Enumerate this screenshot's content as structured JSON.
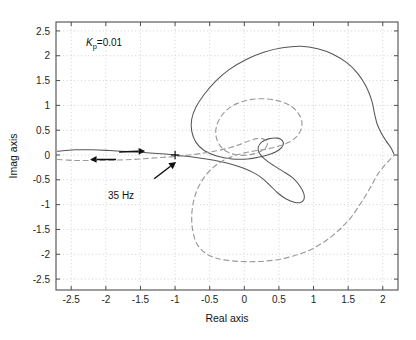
{
  "chart_data": {
    "type": "line",
    "title": "",
    "xlabel": "Real axis",
    "ylabel": "Imag axis",
    "xlim": [
      -2.72,
      2.22
    ],
    "ylim": [
      -2.72,
      2.68
    ],
    "xticks": [
      "-2.5",
      "-2",
      "-1.5",
      "-1",
      "-0.5",
      "0",
      "0.5",
      "1",
      "1.5",
      "2"
    ],
    "xtick_values": [
      -2.5,
      -2,
      -1.5,
      -1,
      -0.5,
      0,
      0.5,
      1,
      1.5,
      2
    ],
    "yticks": [
      "2.5",
      "2",
      "1.5",
      "1",
      "0.5",
      "0",
      "-0.5",
      "-1",
      "-1.5",
      "-2",
      "-2.5"
    ],
    "ytick_values": [
      2.5,
      2,
      1.5,
      1,
      0.5,
      0,
      -0.5,
      -1,
      -1.5,
      -2,
      -2.5
    ],
    "grid": true,
    "grid_style": "dotted",
    "legend": "none",
    "annotations": [
      {
        "name": "gain-annotation",
        "text_prefix": "K",
        "text_sub": "p",
        "text_suffix": "=0.01",
        "x": -2.1,
        "y": 2.28
      },
      {
        "name": "frequency-annotation",
        "text": "35 Hz",
        "x": -1.62,
        "y": -0.62,
        "points_to_x": -1.0,
        "points_to_y": -0.02
      }
    ],
    "markers": [
      {
        "name": "critical-point-marker",
        "symbol": "+",
        "x": -1.0,
        "y": 0.0
      }
    ],
    "direction_arrows": [
      {
        "name": "direction-arrow-right",
        "x": -1.62,
        "y": 0.06,
        "direction": "right",
        "series": "upper-solid"
      },
      {
        "name": "direction-arrow-left",
        "x": -2.04,
        "y": -0.09,
        "direction": "left",
        "series": "lower-dashed"
      }
    ],
    "series": [
      {
        "name": "nyquist-upper-solid",
        "style": "solid",
        "color": "#555555",
        "points": [
          [
            -2.7,
            0.075
          ],
          [
            -2.45,
            0.105
          ],
          [
            -2.2,
            0.105
          ],
          [
            -1.95,
            0.09
          ],
          [
            -1.7,
            0.07
          ],
          [
            -1.45,
            0.05
          ],
          [
            -1.2,
            0.025
          ],
          [
            -1.0,
            0.0
          ],
          [
            -0.8,
            -0.03
          ],
          [
            -0.55,
            -0.08
          ],
          [
            -0.35,
            -0.13
          ],
          [
            -0.15,
            -0.2
          ],
          [
            0.0,
            -0.27
          ],
          [
            0.14,
            -0.36
          ],
          [
            0.26,
            -0.47
          ],
          [
            0.37,
            -0.61
          ],
          [
            0.48,
            -0.76
          ],
          [
            0.6,
            -0.88
          ],
          [
            0.72,
            -0.95
          ],
          [
            0.8,
            -0.96
          ],
          [
            0.86,
            -0.9
          ],
          [
            0.86,
            -0.78
          ],
          [
            0.8,
            -0.62
          ],
          [
            0.7,
            -0.46
          ],
          [
            0.56,
            -0.33
          ],
          [
            0.42,
            -0.21
          ],
          [
            0.3,
            -0.09
          ],
          [
            0.22,
            0.03
          ],
          [
            0.2,
            0.15
          ],
          [
            0.25,
            0.26
          ],
          [
            0.36,
            0.33
          ],
          [
            0.48,
            0.34
          ],
          [
            0.55,
            0.29
          ],
          [
            0.56,
            0.2
          ],
          [
            0.5,
            0.1
          ],
          [
            0.38,
            0.02
          ],
          [
            0.22,
            -0.04
          ],
          [
            0.05,
            -0.08
          ],
          [
            -0.18,
            -0.08
          ],
          [
            -0.4,
            -0.02
          ],
          [
            -0.58,
            0.09
          ],
          [
            -0.7,
            0.26
          ],
          [
            -0.76,
            0.48
          ],
          [
            -0.76,
            0.72
          ],
          [
            -0.7,
            0.96
          ],
          [
            -0.58,
            1.22
          ],
          [
            -0.42,
            1.48
          ],
          [
            -0.22,
            1.72
          ],
          [
            0.02,
            1.92
          ],
          [
            0.28,
            2.07
          ],
          [
            0.55,
            2.16
          ],
          [
            0.82,
            2.19
          ],
          [
            1.06,
            2.14
          ],
          [
            1.28,
            2.03
          ],
          [
            1.48,
            1.86
          ],
          [
            1.64,
            1.64
          ],
          [
            1.76,
            1.38
          ],
          [
            1.84,
            1.1
          ],
          [
            1.88,
            0.84
          ],
          [
            1.92,
            0.62
          ],
          [
            1.98,
            0.44
          ],
          [
            2.05,
            0.28
          ],
          [
            2.12,
            0.14
          ],
          [
            2.16,
            0.02
          ]
        ]
      },
      {
        "name": "nyquist-lower-dashed",
        "style": "dashed",
        "color": "#9a9a9a",
        "points": [
          [
            -2.7,
            -0.09
          ],
          [
            -2.45,
            -0.11
          ],
          [
            -2.2,
            -0.11
          ],
          [
            -1.95,
            -0.105
          ],
          [
            -1.7,
            -0.095
          ],
          [
            -1.45,
            -0.075
          ],
          [
            -1.2,
            -0.05
          ],
          [
            -1.0,
            -0.03
          ],
          [
            -0.8,
            0.0
          ],
          [
            -0.58,
            0.04
          ],
          [
            -0.38,
            0.09
          ],
          [
            -0.2,
            0.15
          ],
          [
            -0.05,
            0.22
          ],
          [
            0.08,
            0.29
          ],
          [
            0.18,
            0.33
          ],
          [
            0.26,
            0.33
          ],
          [
            0.32,
            0.28
          ],
          [
            0.33,
            0.2
          ],
          [
            0.28,
            0.11
          ],
          [
            0.18,
            0.04
          ],
          [
            0.05,
            0.0
          ],
          [
            -0.1,
            0.0
          ],
          [
            -0.24,
            0.06
          ],
          [
            -0.34,
            0.17
          ],
          [
            -0.4,
            0.33
          ],
          [
            -0.41,
            0.52
          ],
          [
            -0.36,
            0.72
          ],
          [
            -0.26,
            0.9
          ],
          [
            -0.1,
            1.04
          ],
          [
            0.1,
            1.12
          ],
          [
            0.32,
            1.13
          ],
          [
            0.52,
            1.08
          ],
          [
            0.68,
            0.98
          ],
          [
            0.78,
            0.84
          ],
          [
            0.83,
            0.68
          ],
          [
            0.82,
            0.52
          ],
          [
            0.76,
            0.38
          ],
          [
            0.65,
            0.26
          ],
          [
            0.5,
            0.18
          ],
          [
            0.33,
            0.12
          ],
          [
            0.14,
            0.08
          ],
          [
            -0.06,
            0.02
          ],
          [
            -0.26,
            -0.08
          ],
          [
            -0.44,
            -0.24
          ],
          [
            -0.58,
            -0.45
          ],
          [
            -0.68,
            -0.7
          ],
          [
            -0.74,
            -0.98
          ],
          [
            -0.76,
            -1.28
          ],
          [
            -0.74,
            -1.56
          ],
          [
            -0.68,
            -1.8
          ],
          [
            -0.56,
            -1.98
          ],
          [
            -0.4,
            -2.08
          ],
          [
            -0.2,
            -2.13
          ],
          [
            0.04,
            -2.15
          ],
          [
            0.28,
            -2.14
          ],
          [
            0.52,
            -2.1
          ],
          [
            0.74,
            -2.02
          ],
          [
            0.94,
            -1.92
          ],
          [
            1.12,
            -1.78
          ],
          [
            1.28,
            -1.62
          ],
          [
            1.42,
            -1.44
          ],
          [
            1.55,
            -1.24
          ],
          [
            1.66,
            -1.02
          ],
          [
            1.76,
            -0.8
          ],
          [
            1.85,
            -0.58
          ],
          [
            1.93,
            -0.38
          ],
          [
            2.02,
            -0.22
          ],
          [
            2.1,
            -0.1
          ],
          [
            2.16,
            -0.01
          ]
        ]
      }
    ]
  },
  "axes": {
    "xlabel": "Real axis",
    "ylabel": "Imag axis"
  },
  "labels": {
    "gain_k": "K",
    "gain_sub": "p",
    "gain_value": "=0.01",
    "frequency": "35 Hz"
  },
  "colors": {
    "solid_trace": "#555555",
    "dashed_trace": "#9a9a9a",
    "grid": "#bdbdbd",
    "axis": "#4d4d4d",
    "text": "#1a1a1a",
    "background": "#ffffff"
  }
}
